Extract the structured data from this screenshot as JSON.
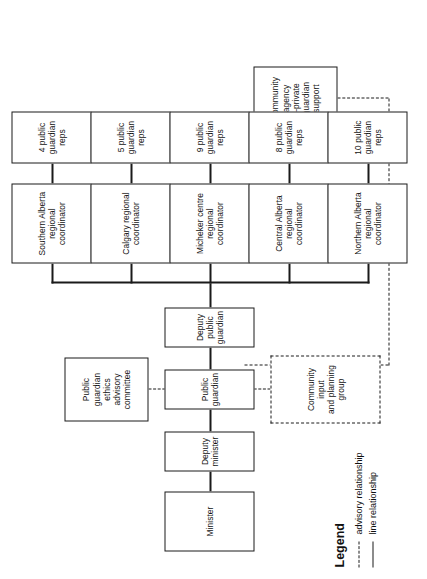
{
  "diagram": {
    "type": "organizational-chart",
    "orientation": "rotated-90-ccw",
    "nodes": {
      "minister": "Minister",
      "deputy_minister": "Deputy minister",
      "public_guardian": "Public guardian",
      "deputy_public_guardian": "Deputy public\nguardian",
      "ethics_committee": "Public guardian\nethics advisory\ncommittee",
      "community_input": "Community input\nand planning\ngroup",
      "community_agency": "Community\nagency\n–private guardian\nsupport"
    },
    "regions": [
      {
        "coordinator": "Southern Alberta\nregional\ncoordinator",
        "reps": "4 public guardian\nreps",
        "rep_count": 4
      },
      {
        "coordinator": "Calgary regional\ncoordinator",
        "reps": "5 public guardian\nreps",
        "rep_count": 5
      },
      {
        "coordinator": "Micheker centre\nregional\ncoordinator",
        "reps": "9 public guardian\nreps",
        "rep_count": 9
      },
      {
        "coordinator": "Central Alberta\nregional\ncoordinator",
        "reps": "8 public guardian\nreps",
        "rep_count": 8
      },
      {
        "coordinator": "Northern Alberta\nregional\ncoordinator",
        "reps": "10 public guardian\nreps",
        "rep_count": 10
      }
    ]
  },
  "legend": {
    "title": "Legend",
    "items": [
      {
        "style": "dashed",
        "label": "advisory relationship"
      },
      {
        "style": "solid",
        "label": "line relationship"
      }
    ]
  },
  "colors": {
    "ink": "#1a1a1a",
    "paper": "#ffffff"
  }
}
